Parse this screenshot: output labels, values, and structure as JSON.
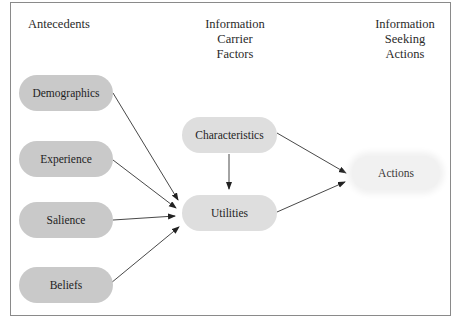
{
  "headings": {
    "antecedents": "Antecedents",
    "carrier": [
      "Information",
      "Carrier",
      "Factors"
    ],
    "seeking": [
      "Information",
      "Seeking",
      "Actions"
    ]
  },
  "nodes": {
    "demographics": "Demographics",
    "experience": "Experience",
    "salience": "Salience",
    "beliefs": "Beliefs",
    "characteristics": "Characteristics",
    "utilities": "Utilities",
    "actions": "Actions"
  },
  "edges": [
    {
      "from": "Demographics",
      "to": "Utilities"
    },
    {
      "from": "Experience",
      "to": "Utilities"
    },
    {
      "from": "Salience",
      "to": "Utilities"
    },
    {
      "from": "Beliefs",
      "to": "Utilities"
    },
    {
      "from": "Characteristics",
      "to": "Utilities"
    },
    {
      "from": "Characteristics",
      "to": "Actions"
    },
    {
      "from": "Utilities",
      "to": "Actions"
    }
  ],
  "colors": {
    "antecedent_node": "#c9c9c9",
    "carrier_node": "#dedede",
    "action_node": "#f1f1f1",
    "frame_border": "#8a8a8a"
  }
}
